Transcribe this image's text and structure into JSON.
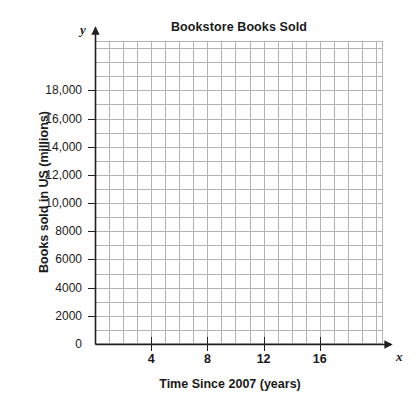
{
  "chart_data": {
    "type": "line",
    "title": "Bookstore Books Sold",
    "xlabel": "Time Since 2007 (years)",
    "ylabel": "Books sold in US (millions)",
    "x_axis_variable": "x",
    "y_axis_variable": "y",
    "xlim": [
      0,
      20.5
    ],
    "ylim": [
      0,
      21500
    ],
    "x_major_ticks": [
      4,
      8,
      12,
      16
    ],
    "x_major_tick_labels": [
      "4",
      "8",
      "12",
      "16"
    ],
    "x_minor_tick_step": 1,
    "y_major_ticks": [
      0,
      2000,
      4000,
      6000,
      8000,
      10000,
      12000,
      14000,
      16000,
      18000
    ],
    "y_major_tick_labels": [
      "0",
      "2000",
      "4000",
      "6000",
      "8000",
      "10,000",
      "12,000",
      "14,000",
      "16,000",
      "18,000"
    ],
    "y_minor_tick_step": 1000,
    "grid": true,
    "grid_color": "#b3b3b3",
    "axis_color": "#231f20",
    "background_color": "#ffffff",
    "legend": null,
    "series": [
      {
        "name": "Books sold",
        "x": [],
        "values": []
      }
    ],
    "annotations": [],
    "note": "Empty coordinate grid; no data points are plotted."
  },
  "chart": {
    "title": "Bookstore Books Sold",
    "x_axis": {
      "title": "Time Since 2007 (years)",
      "variable": "x",
      "tick_labels": [
        "4",
        "8",
        "12",
        "16"
      ]
    },
    "y_axis": {
      "title": "Books sold in US (millions)",
      "variable": "y",
      "tick_labels": [
        "18,000",
        "16,000",
        "14,000",
        "12,000",
        "10,000",
        "8000",
        "6000",
        "4000",
        "2000",
        "0"
      ]
    }
  }
}
